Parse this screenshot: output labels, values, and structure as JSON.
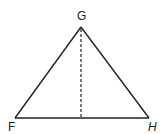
{
  "diagram": {
    "type": "isosceles-triangle-with-altitude",
    "vertices": {
      "G": {
        "label": "G",
        "x": 81,
        "y": 27
      },
      "F": {
        "label": "F",
        "x": 15,
        "y": 118
      },
      "H": {
        "label": "H",
        "x": 149,
        "y": 118
      }
    },
    "altitude": {
      "from": "G",
      "foot": {
        "x": 81,
        "y": 118
      },
      "style": "dashed"
    },
    "colors": {
      "stroke": "#222222",
      "background": "#ffffff"
    }
  }
}
